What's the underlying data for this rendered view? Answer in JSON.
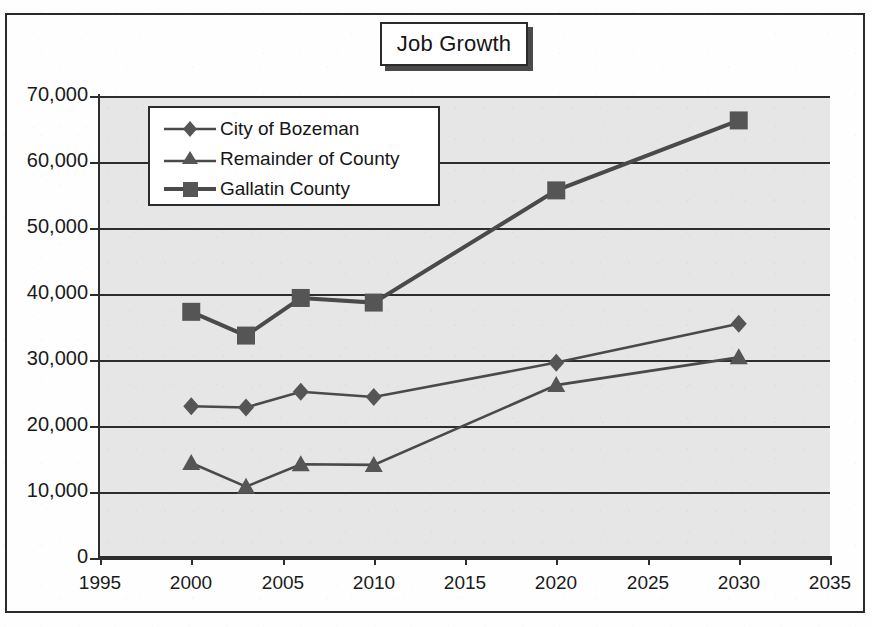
{
  "title": {
    "text": "Job Growth"
  },
  "legend": {
    "items": [
      {
        "label": "City of Bozeman",
        "marker": "diamond-marker"
      },
      {
        "label": "Remainder of County",
        "marker": "triangle-marker"
      },
      {
        "label": "Gallatin County",
        "marker": "square-marker"
      }
    ]
  },
  "axes": {
    "y_ticks": [
      "70,000",
      "60,000",
      "50,000",
      "40,000",
      "30,000",
      "20,000",
      "10,000",
      "0"
    ],
    "x_ticks": [
      "1995",
      "2000",
      "2005",
      "2010",
      "2015",
      "2020",
      "2025",
      "2030",
      "2035"
    ]
  },
  "colors": {
    "line": "#4a4a4a",
    "marker": "#555555",
    "grid": "#2d2d2d",
    "plot_background": "#e6e6e6",
    "page_background": "#fefefe",
    "text": "#1a1a1a"
  },
  "chart_data": {
    "type": "line",
    "title": "Job Growth",
    "xlabel": "",
    "ylabel": "",
    "xlim": [
      1995,
      2035
    ],
    "ylim": [
      0,
      70000
    ],
    "grid": true,
    "legend_position": "upper-left-inside",
    "x": [
      2000,
      2003,
      2006,
      2010,
      2020,
      2030
    ],
    "series": [
      {
        "name": "City of Bozeman",
        "marker": "diamond",
        "values": [
          23000,
          22800,
          25200,
          24400,
          29600,
          35500
        ]
      },
      {
        "name": "Remainder of County",
        "marker": "triangle",
        "values": [
          14400,
          10800,
          14200,
          14100,
          26200,
          30400
        ]
      },
      {
        "name": "Gallatin County",
        "marker": "square",
        "values": [
          37300,
          33700,
          39400,
          38700,
          55700,
          66300
        ]
      }
    ]
  }
}
